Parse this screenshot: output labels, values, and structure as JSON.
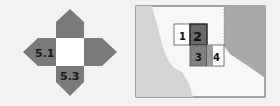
{
  "left_diagram": {
    "labels": {
      "left": "5.1",
      "bottom": "5.3"
    },
    "colors": {
      "arm": "#7a7a7a",
      "center": "#ffffff",
      "text": "#1a1a1a"
    }
  },
  "right_map": {
    "grid_labels": [
      "1",
      "2",
      "3",
      "4"
    ],
    "colors": {
      "land_left": "#d4d4d4",
      "land_right": "#a8a8a8",
      "ocean": "#f7f7f7",
      "cell_light": "#ffffff",
      "cell_dark": "#808080",
      "cell_highlight": "#6a6a6a",
      "border": "#555555"
    }
  }
}
